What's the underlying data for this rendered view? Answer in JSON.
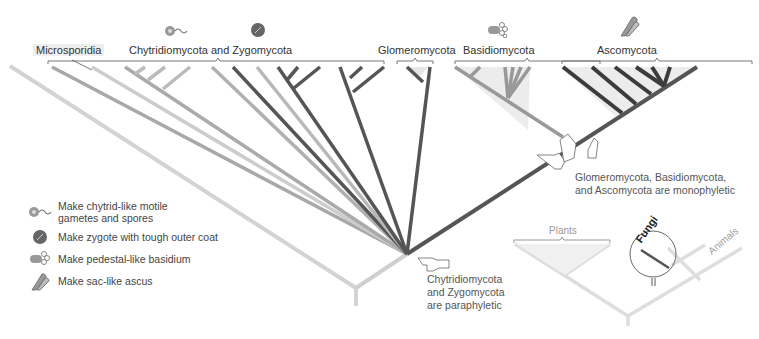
{
  "groups": {
    "microsporidia": "Microsporidia",
    "chytrid_zygo": "Chytridiomycota and Zygomycota",
    "glomeromycota": "Glomeromycota",
    "basidiomycota": "Basidiomycota",
    "ascomycota": "Ascomycota"
  },
  "icons": {
    "chytrid": "chytrid-motile-spore-icon",
    "zygote": "zygote-coat-icon",
    "basidium": "basidium-icon",
    "ascus": "ascus-icon"
  },
  "legend": {
    "items": [
      {
        "icon": "chytrid-motile-spore-icon",
        "label_line1": "Make chytrid-like motile",
        "label_line2": "gametes and spores"
      },
      {
        "icon": "zygote-coat-icon",
        "label_line1": "Make zygote with tough outer coat"
      },
      {
        "icon": "basidium-icon",
        "label_line1": "Make pedestal-like basidium"
      },
      {
        "icon": "ascus-icon",
        "label_line1": "Make sac-like ascus"
      }
    ]
  },
  "annotations": {
    "paraphyletic": [
      "Chytridiomycota",
      "and Zygomycota",
      "are paraphyletic"
    ],
    "monophyletic": [
      "Glomeromycota, Basidiomycota,",
      "and Ascomycota are monophyletic"
    ]
  },
  "inset": {
    "plants": "Plants",
    "fungi": "Fungi",
    "animals": "Animals"
  },
  "colors": {
    "light_gray": "#d0d0d0",
    "mid_gray": "#a8a8a8",
    "dark_gray": "#5a5a5a",
    "darkest": "#3c3c3c",
    "fill": "#ececec"
  }
}
